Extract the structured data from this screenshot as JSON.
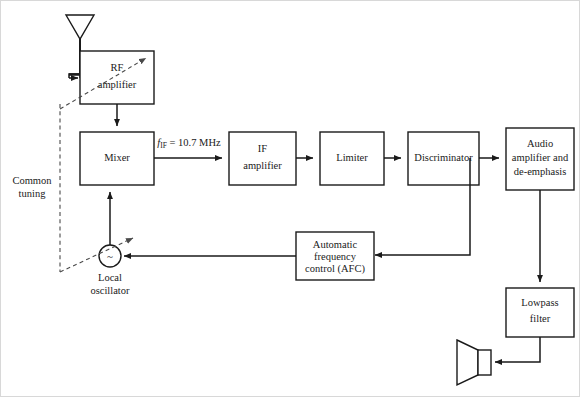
{
  "figure": {
    "line_color": "#1a1a1a",
    "dashed_color": "#4a4a4a",
    "background": "#ffffff"
  },
  "blocks": {
    "rf_amplifier": {
      "line1": "RF",
      "line2": "amplifier"
    },
    "mixer": {
      "line1": "Mixer"
    },
    "if_amplifier": {
      "line1": "IF",
      "line2": "amplifier"
    },
    "limiter": {
      "line1": "Limiter"
    },
    "discriminator": {
      "line1": "Discriminator"
    },
    "audio_amplifier": {
      "line1": "Audio",
      "line2": "amplifier and",
      "line3": "de-emphasis"
    },
    "afc": {
      "line1": "Automatic",
      "line2": "frequency",
      "line3": "control (AFC)"
    },
    "lowpass_filter": {
      "line1": "Lowpass",
      "line2": "filter"
    }
  },
  "labels": {
    "common_tuning": {
      "line1": "Common",
      "line2": "tuning"
    },
    "local_oscillator": {
      "line1": "Local",
      "line2": "oscillator",
      "symbol": "~"
    },
    "if_frequency": {
      "symbol": "f",
      "subscript": "IF",
      "equals": " = 10.7 MHz"
    }
  },
  "symbols": {
    "antenna": "antenna-icon",
    "speaker": "speaker-icon",
    "oscillator": "oscillator-icon"
  }
}
